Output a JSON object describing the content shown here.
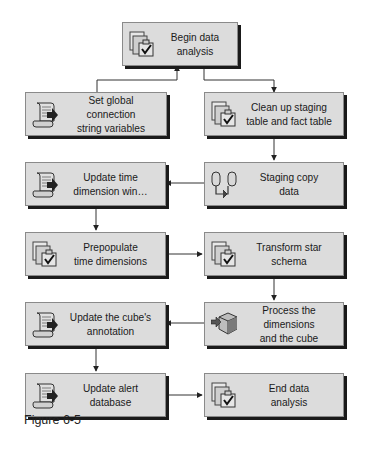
{
  "diagram": {
    "type": "flowchart",
    "nodes": [
      {
        "id": "begin",
        "label": "Begin data\nanalysis",
        "icon": "task-check-icon"
      },
      {
        "id": "set_global",
        "label": "Set global connection\nstring variables",
        "icon": "script-icon"
      },
      {
        "id": "cleanup",
        "label": "Clean up staging\ntable and fact table",
        "icon": "task-check-icon"
      },
      {
        "id": "update_time",
        "label": "Update time\ndimension win…",
        "icon": "script-icon"
      },
      {
        "id": "staging_copy",
        "label": "Staging copy\ndata",
        "icon": "data-flow-icon"
      },
      {
        "id": "prepopulate",
        "label": "Prepopulate\ntime dimensions",
        "icon": "task-check-icon"
      },
      {
        "id": "transform",
        "label": "Transform star\nschema",
        "icon": "task-check-icon"
      },
      {
        "id": "update_annotation",
        "label": "Update the cube's\nannotation",
        "icon": "script-icon"
      },
      {
        "id": "process_cube",
        "label": "Process the dimensions\nand the cube",
        "icon": "cube-icon"
      },
      {
        "id": "update_alert",
        "label": "Update alert\ndatabase",
        "icon": "script-icon"
      },
      {
        "id": "end",
        "label": "End data\nanalysis",
        "icon": "task-check-icon"
      }
    ],
    "edges": [
      {
        "from": "set_global",
        "to": "begin"
      },
      {
        "from": "begin",
        "to": "cleanup"
      },
      {
        "from": "cleanup",
        "to": "staging_copy"
      },
      {
        "from": "staging_copy",
        "to": "update_time"
      },
      {
        "from": "update_time",
        "to": "prepopulate"
      },
      {
        "from": "prepopulate",
        "to": "transform"
      },
      {
        "from": "transform",
        "to": "process_cube"
      },
      {
        "from": "process_cube",
        "to": "update_annotation"
      },
      {
        "from": "update_annotation",
        "to": "update_alert"
      },
      {
        "from": "update_alert",
        "to": "end"
      }
    ]
  },
  "caption": "Figure 6-5",
  "colors": {
    "box_fill": "#dcdcdc",
    "box_border": "#8a8a8a",
    "shadow": "#1a1a1a",
    "line": "#333333"
  }
}
